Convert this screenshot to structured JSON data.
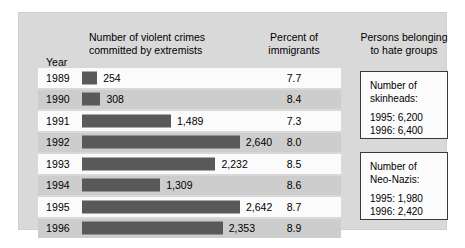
{
  "headers": {
    "crimes": "Number of violent crimes\ncommitted by extremists",
    "percent": "Percent of\nimmigrants",
    "hate_groups": "Persons belonging\nto hate groups",
    "year": "Year"
  },
  "side_boxes": [
    {
      "name": "skinheads",
      "title": "Number of\nskinheads:",
      "lines": "1995: 6,200\n1996: 6,400"
    },
    {
      "name": "neo-nazis",
      "title": "Number of\nNeo-Nazis:",
      "lines": "1995: 1,980\n1996: 2,420"
    }
  ],
  "colors": {
    "panel_background": "#d9d9d9",
    "bar": "#595959",
    "row_light": "#fbfbfb",
    "row_dark": "#cdcdcd",
    "box_border": "#3a3a3a",
    "text": "#000000"
  },
  "chart_data": {
    "type": "bar",
    "orientation": "horizontal",
    "title": "",
    "xlabel": "",
    "ylabel": "Year",
    "grid": false,
    "legend": "none",
    "categories": [
      "1989",
      "1990",
      "1991",
      "1992",
      "1993",
      "1994",
      "1995",
      "1996"
    ],
    "series": [
      {
        "name": "Number of violent crimes committed by extremists",
        "values": [
          254,
          308,
          1489,
          2640,
          2232,
          1309,
          2642,
          2353
        ],
        "labels": [
          "254",
          "308",
          "1,489",
          "2,640",
          "2,232",
          "1,309",
          "2,642",
          "2,353"
        ]
      },
      {
        "name": "Percent of immigrants",
        "values": [
          7.7,
          8.4,
          7.3,
          8.0,
          8.5,
          8.6,
          8.7,
          8.9
        ],
        "labels": [
          "7.7",
          "8.4",
          "7.3",
          "8.0",
          "8.5",
          "8.6",
          "8.7",
          "8.9"
        ]
      }
    ],
    "xlim": [
      0,
      2800
    ],
    "annotations": [
      "Number of skinheads: 1995: 6,200; 1996: 6,400",
      "Number of Neo-Nazis: 1995: 1,980; 1996: 2,420"
    ]
  }
}
